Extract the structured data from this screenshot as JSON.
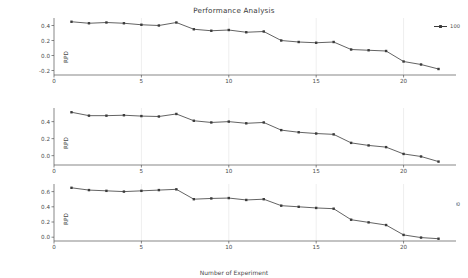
{
  "chart_data": [
    {
      "type": "line",
      "title": "Performance Analysis",
      "xlabel": "",
      "ylabel": "RPD",
      "legend": [
        "100"
      ],
      "legend_position": "upper right outside",
      "grid": true,
      "xlim": [
        0,
        23
      ],
      "ylim": [
        -0.26,
        0.5
      ],
      "xticks": [
        0,
        5,
        10,
        15,
        20
      ],
      "yticks": [
        -0.2,
        0.0,
        0.2,
        0.4
      ],
      "ytick_labels": [
        "-0.2",
        "0.0",
        "0.2",
        "0.4"
      ],
      "xtick_labels": [
        "0",
        "5",
        "10",
        "15",
        "20"
      ],
      "x": [
        1,
        2,
        3,
        4,
        5,
        6,
        7,
        8,
        9,
        10,
        11,
        12,
        13,
        14,
        15,
        16,
        17,
        18,
        19,
        20,
        21,
        22
      ],
      "series": [
        {
          "name": "100",
          "values": [
            0.45,
            0.43,
            0.44,
            0.43,
            0.41,
            0.4,
            0.44,
            0.35,
            0.33,
            0.34,
            0.31,
            0.32,
            0.2,
            0.18,
            0.17,
            0.18,
            0.08,
            0.07,
            0.06,
            -0.08,
            -0.12,
            -0.18
          ]
        }
      ]
    },
    {
      "type": "line",
      "title": "",
      "xlabel": "",
      "ylabel": "RPD",
      "legend": [
        "200"
      ],
      "legend_position": "upper right outside",
      "grid": true,
      "xlim": [
        0,
        23
      ],
      "ylim": [
        -0.11,
        0.56
      ],
      "xticks": [
        0,
        5,
        10,
        15,
        20
      ],
      "yticks": [
        0.0,
        0.2,
        0.4
      ],
      "ytick_labels": [
        "0.0",
        "0.2",
        "0.4"
      ],
      "xtick_labels": [
        "0",
        "5",
        "10",
        "15",
        "20"
      ],
      "x": [
        1,
        2,
        3,
        4,
        5,
        6,
        7,
        8,
        9,
        10,
        11,
        12,
        13,
        14,
        15,
        16,
        17,
        18,
        19,
        20,
        21,
        22
      ],
      "series": [
        {
          "name": "200",
          "values": [
            0.51,
            0.47,
            0.47,
            0.475,
            0.465,
            0.46,
            0.49,
            0.41,
            0.39,
            0.4,
            0.38,
            0.39,
            0.3,
            0.275,
            0.26,
            0.25,
            0.15,
            0.12,
            0.1,
            0.02,
            -0.01,
            -0.07
          ]
        }
      ]
    },
    {
      "type": "line",
      "title": "",
      "xlabel": "Number of Experiment",
      "ylabel": "RPD",
      "legend": [
        "400"
      ],
      "legend_position": "upper right outside",
      "grid": true,
      "xlim": [
        0,
        23
      ],
      "ylim": [
        -0.05,
        0.7
      ],
      "xticks": [
        0,
        5,
        10,
        15,
        20
      ],
      "yticks": [
        0.0,
        0.2,
        0.4,
        0.6
      ],
      "ytick_labels": [
        "0.0",
        "0.2",
        "0.4",
        "0.6"
      ],
      "xtick_labels": [
        "0",
        "5",
        "10",
        "15",
        "20"
      ],
      "x": [
        1,
        2,
        3,
        4,
        5,
        6,
        7,
        8,
        9,
        10,
        11,
        12,
        13,
        14,
        15,
        16,
        17,
        18,
        19,
        20,
        21,
        22
      ],
      "series": [
        {
          "name": "400",
          "values": [
            0.65,
            0.62,
            0.61,
            0.6,
            0.61,
            0.62,
            0.63,
            0.5,
            0.51,
            0.515,
            0.49,
            0.5,
            0.415,
            0.4,
            0.385,
            0.375,
            0.23,
            0.195,
            0.16,
            0.03,
            -0.005,
            -0.02
          ]
        }
      ]
    }
  ],
  "figure": {
    "title": "Performance Analysis",
    "xlabel": "Number of Experiment",
    "line_color": "#3b3b3b",
    "grid_color": "#dddddd",
    "axis_color": "#555555",
    "background": "#ffffff"
  },
  "panels": [
    {
      "ylabel": "RPD",
      "legend_label": "100"
    },
    {
      "ylabel": "RPD",
      "legend_label": "200"
    },
    {
      "ylabel": "RPD",
      "legend_label": "400"
    }
  ]
}
